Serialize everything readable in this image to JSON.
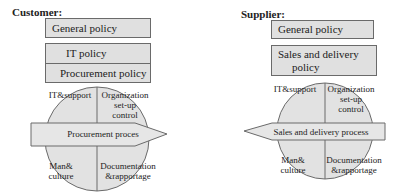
{
  "customer": {
    "heading": "Customer:",
    "boxes": [
      {
        "label": "General policy"
      },
      {
        "label": "IT policy"
      },
      {
        "label": "Procurement policy"
      }
    ],
    "wheel": {
      "quadrants": {
        "top_left": "IT&support",
        "top_right_line1": "Organization",
        "top_right_line2": "set-up",
        "top_right_line3": "control",
        "bottom_left_line1": "Man&",
        "bottom_left_line2": "culture",
        "bottom_right_line1": "Documentation",
        "bottom_right_line2": "&rapportage"
      },
      "arrow_label": "Procurement proces",
      "arrow_direction": "right"
    }
  },
  "supplier": {
    "heading": "Supplier:",
    "boxes": [
      {
        "label": "General policy"
      },
      {
        "label_line1": "Sales and delivery",
        "label_line2": "policy"
      }
    ],
    "wheel": {
      "quadrants": {
        "top_left": "IT&support",
        "top_right_line1": "Organization",
        "top_right_line2": "set-up",
        "top_right_line3": "control",
        "bottom_left_line1": "Man&",
        "bottom_left_line2": "culture",
        "bottom_right_line1": "Documentation",
        "bottom_right_line2": "&rapportage"
      },
      "arrow_label": "Sales and delivery process",
      "arrow_direction": "left"
    }
  },
  "colors": {
    "box_fill": "#e0e0e0",
    "circle_fill": "#e2e2e2",
    "arrow_fill": "#e6e6e6",
    "stroke": "#6a6a6a"
  }
}
